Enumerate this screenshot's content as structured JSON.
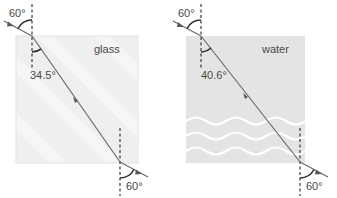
{
  "diagram": {
    "type": "refraction",
    "panels": [
      {
        "material": "glass",
        "incident_angle": "60°",
        "refracted_angle": "34.5°",
        "emergent_angle": "60°",
        "fill": "#efefef"
      },
      {
        "material": "water",
        "incident_angle": "60°",
        "refracted_angle": "40.6°",
        "emergent_angle": "60°",
        "fill": "#e4e4e4"
      }
    ],
    "colors": {
      "ray": "#6a6a6a",
      "normal": "#3a3a3a",
      "arc": "#2e2e2e",
      "wave": "#ffffff"
    }
  }
}
